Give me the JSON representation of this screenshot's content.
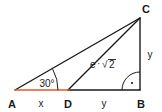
{
  "diagram": {
    "type": "geometry-triangle-diagram",
    "colors": {
      "stroke": "#1a1a1a",
      "highlight": "#e8542a",
      "background": "#ffffff"
    },
    "vertices": [
      {
        "name": "A",
        "label": "A",
        "x": 15,
        "y": 90
      },
      {
        "name": "D",
        "label": "D",
        "x": 68,
        "y": 90
      },
      {
        "name": "B",
        "label": "B",
        "x": 140,
        "y": 90
      },
      {
        "name": "C",
        "label": "C",
        "x": 140,
        "y": 18
      }
    ],
    "segments": [
      {
        "name": "segment-AD",
        "from": "A",
        "to": "D",
        "highlighted": true
      },
      {
        "name": "segment-DB",
        "from": "D",
        "to": "B",
        "highlighted": false
      },
      {
        "name": "segment-AC",
        "from": "A",
        "to": "C",
        "highlighted": false
      },
      {
        "name": "segment-DC",
        "from": "D",
        "to": "C",
        "highlighted": false
      },
      {
        "name": "segment-CB",
        "from": "C",
        "to": "B",
        "highlighted": false
      }
    ],
    "labels": {
      "vertex_a": "A",
      "vertex_d": "D",
      "vertex_b": "B",
      "vertex_c": "C",
      "side_ad": "x",
      "side_db": "y",
      "side_cb": "y",
      "hypotenuse_dc_base": "e",
      "hypotenuse_dc_operator": "·",
      "hypotenuse_dc_radicand": "2",
      "hypotenuse_dc_full": "e·√2",
      "angle_a": "30°"
    },
    "angles": [
      {
        "name": "angle-at-A",
        "vertex": "A",
        "measure": "30°",
        "marker": "arc"
      },
      {
        "name": "angle-at-B",
        "vertex": "B",
        "measure": "90°",
        "marker": "right-angle-arc-dot"
      }
    ]
  }
}
